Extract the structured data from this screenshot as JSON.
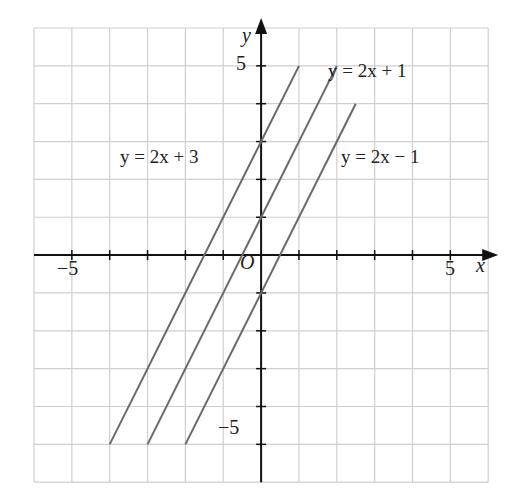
{
  "chart_data": {
    "type": "line",
    "title": "",
    "xlabel": "x",
    "ylabel": "y",
    "origin_label": "O",
    "xlim": [
      -6,
      6
    ],
    "ylim": [
      -6,
      6
    ],
    "grid": true,
    "x_tick_labels": [
      {
        "value": -5,
        "label": "−5"
      },
      {
        "value": 5,
        "label": "5"
      }
    ],
    "y_tick_labels": [
      {
        "value": 5,
        "label": "5"
      },
      {
        "value": -5,
        "label": "−5"
      }
    ],
    "series": [
      {
        "name": "y = 2x + 3",
        "slope": 2,
        "intercept": 3,
        "x": [
          -4,
          1
        ],
        "y": [
          -5,
          5
        ]
      },
      {
        "name": "y = 2x + 1",
        "slope": 2,
        "intercept": 1,
        "x": [
          -3,
          2
        ],
        "y": [
          -5,
          5
        ]
      },
      {
        "name": "y = 2x − 1",
        "slope": 2,
        "intercept": -1,
        "x": [
          -2,
          2.5
        ],
        "y": [
          -5,
          4
        ]
      }
    ]
  },
  "labels": {
    "eq1": "y = 2x + 3",
    "eq2": "y = 2x + 1",
    "eq3": "y = 2x − 1",
    "x_axis": "x",
    "y_axis": "y",
    "origin": "O",
    "x_neg5": "−5",
    "x_pos5": "5",
    "y_pos5": "5",
    "y_neg5": "−5"
  },
  "colors": {
    "grid": "#cfcfcf",
    "axis": "#111111",
    "line": "#6a6a6a"
  }
}
